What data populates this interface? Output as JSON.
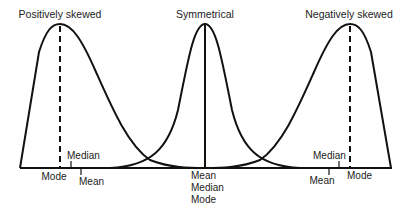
{
  "diagram": {
    "panels": [
      {
        "title": "Positively skewed",
        "labels": {
          "mode": "Mode",
          "median": "Median",
          "mean": "Mean"
        }
      },
      {
        "title": "Symmetrical",
        "labels": {
          "mean": "Mean",
          "median": "Median",
          "mode": "Mode"
        }
      },
      {
        "title": "Negatively skewed",
        "labels": {
          "median": "Median",
          "mean": "Mean",
          "mode": "Mode"
        }
      }
    ],
    "colors": {
      "line": "#111111",
      "text": "#222222",
      "background": "#ffffff"
    }
  }
}
